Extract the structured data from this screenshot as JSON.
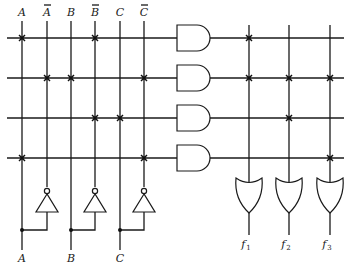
{
  "diagram": {
    "type": "programmable-logic-array",
    "colors": {
      "ink": "#1a1a1a",
      "background": "#ffffff"
    },
    "input_columns": [
      {
        "label": "A",
        "overbar": false,
        "x": 22
      },
      {
        "label": "A",
        "overbar": true,
        "x": 47
      },
      {
        "label": "B",
        "overbar": false,
        "x": 71
      },
      {
        "label": "B",
        "overbar": true,
        "x": 95
      },
      {
        "label": "C",
        "overbar": false,
        "x": 120
      },
      {
        "label": "C",
        "overbar": true,
        "x": 144
      }
    ],
    "bottom_inputs": [
      {
        "label": "A",
        "x": 22
      },
      {
        "label": "B",
        "x": 71
      },
      {
        "label": "C",
        "x": 120
      }
    ],
    "product_rows_y": [
      38,
      78,
      118,
      158
    ],
    "and_plane_connections": [
      [
        0,
        3
      ],
      [
        1,
        2,
        5
      ],
      [
        3,
        4
      ],
      [
        0,
        5
      ]
    ],
    "output_columns": [
      {
        "label": "f",
        "sub": "1",
        "x": 249
      },
      {
        "label": "f",
        "sub": "2",
        "x": 289
      },
      {
        "label": "f",
        "sub": "3",
        "x": 330
      }
    ],
    "or_plane_connections": [
      [
        0
      ],
      [
        0,
        1,
        2
      ],
      [
        1
      ],
      [
        2
      ]
    ]
  }
}
